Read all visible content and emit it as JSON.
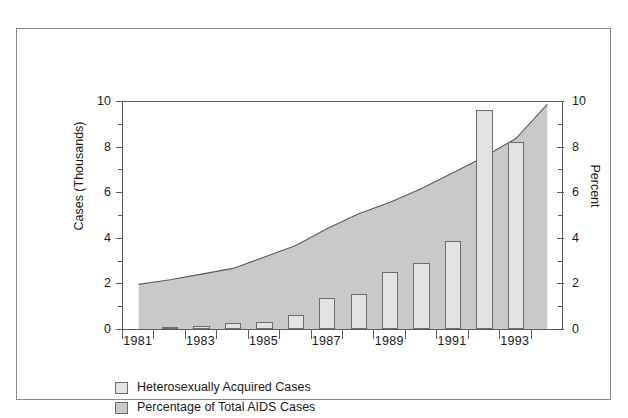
{
  "chart_data": {
    "type": "bar",
    "title": "",
    "subtitle": "",
    "xlabel": "",
    "ylabel": "Cases (Thousands)",
    "y2label": "Percent",
    "ylim": [
      0,
      10
    ],
    "y2lim": [
      0,
      10
    ],
    "grid": false,
    "legend_position": "bottom-left",
    "y_ticks": [
      "0",
      "2",
      "4",
      "6",
      "8",
      "10"
    ],
    "y_tick_values": [
      0,
      2,
      4,
      6,
      8,
      10
    ],
    "y_minor_values": [
      1,
      3,
      5,
      7,
      9
    ],
    "y2_ticks": [
      "0",
      "2",
      "4",
      "6",
      "8",
      "10"
    ],
    "y2_tick_values": [
      0,
      2,
      4,
      6,
      8,
      10
    ],
    "categories": [
      "1981",
      "1982",
      "1983",
      "1984",
      "1985",
      "1986",
      "1987",
      "1988",
      "1989",
      "1990",
      "1991",
      "1992",
      "1993",
      "1994"
    ],
    "x_tick_labels": [
      "1981",
      "",
      "1983",
      "",
      "1985",
      "",
      "1987",
      "",
      "1989",
      "",
      "1991",
      "",
      "1993",
      ""
    ],
    "series": [
      {
        "name": "Heterosexually Acquired Cases",
        "type": "bar",
        "axis": "left",
        "color": "#e3e3e3",
        "edge_color": "#6d6d6d",
        "values": [
          0,
          0.1,
          0.15,
          0.25,
          0.3,
          0.6,
          1.35,
          1.55,
          2.5,
          2.9,
          3.85,
          9.6,
          8.2,
          0
        ]
      },
      {
        "name": "Percentage of Total AIDS Cases",
        "type": "area",
        "axis": "right",
        "color": "#c9c9c9",
        "edge_color": "#5a5a5a",
        "values": [
          2.0,
          2.2,
          2.45,
          2.7,
          3.2,
          3.7,
          4.45,
          5.1,
          5.6,
          6.2,
          6.9,
          7.6,
          8.4,
          9.9
        ]
      }
    ]
  },
  "legend": {
    "items": [
      {
        "label": "Heterosexually Acquired Cases",
        "color": "#e3e3e3"
      },
      {
        "label": "Percentage of Total AIDS Cases",
        "color": "#c9c9c9"
      }
    ]
  }
}
